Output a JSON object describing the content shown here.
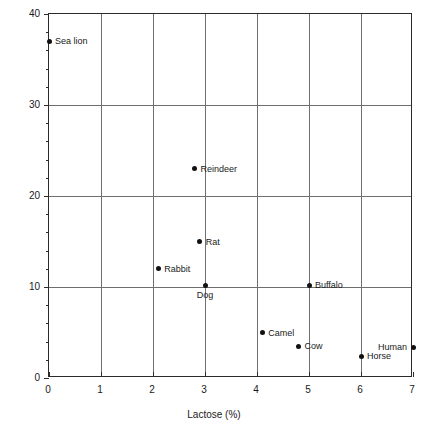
{
  "chart_data": {
    "type": "scatter",
    "title": "",
    "xlabel": "Lactose (%)",
    "ylabel": "Fat (%)",
    "xlim": [
      0,
      7
    ],
    "ylim": [
      0,
      40
    ],
    "xticks": [
      0,
      1,
      2,
      3,
      4,
      5,
      6,
      7
    ],
    "xtick_labels": [
      "0",
      "1",
      "2",
      "3",
      "4",
      "5",
      "6",
      "7"
    ],
    "yticks": [
      0,
      10,
      20,
      30,
      40
    ],
    "ytick_labels": [
      "0",
      "10",
      "20",
      "30",
      "40"
    ],
    "y_minor_tick_step": 2,
    "grid": "both",
    "gridlines_x": [
      1,
      2,
      3,
      4,
      5,
      6
    ],
    "gridlines_y": [
      10,
      20,
      30
    ],
    "legend": "none",
    "points": [
      {
        "label": "Sea lion",
        "x": 0.0,
        "y": 37.0,
        "label_pos": "right"
      },
      {
        "label": "Reindeer",
        "x": 2.8,
        "y": 23.0,
        "label_pos": "right"
      },
      {
        "label": "Rat",
        "x": 2.9,
        "y": 15.0,
        "label_pos": "right"
      },
      {
        "label": "Rabbit",
        "x": 2.1,
        "y": 12.0,
        "label_pos": "right"
      },
      {
        "label": "Dog",
        "x": 3.0,
        "y": 10.2,
        "label_pos": "below"
      },
      {
        "label": "Buffalo",
        "x": 5.0,
        "y": 10.2,
        "label_pos": "right"
      },
      {
        "label": "Camel",
        "x": 4.1,
        "y": 5.0,
        "label_pos": "right"
      },
      {
        "label": "Cow",
        "x": 4.8,
        "y": 3.5,
        "label_pos": "right"
      },
      {
        "label": "Horse",
        "x": 6.0,
        "y": 2.4,
        "label_pos": "right"
      },
      {
        "label": "Human",
        "x": 7.0,
        "y": 3.4,
        "label_pos": "left"
      }
    ]
  },
  "colors": {
    "point": "#111111",
    "grid": "#6f6f6f",
    "axis": "#2b2b2b",
    "text": "#1a1a1a",
    "background": "#ffffff"
  }
}
